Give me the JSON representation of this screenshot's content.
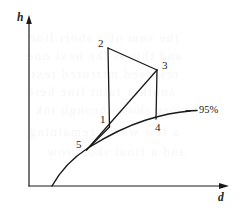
{
  "figure": {
    "type": "thermodynamic-cycle-diagram",
    "background_color": "#ffffff",
    "line_color": "#1a1a1a",
    "axes": {
      "y_label": "h",
      "x_label": "d",
      "y_axis": {
        "x": 29,
        "y_top": 18,
        "y_bottom": 186
      },
      "x_axis": {
        "y": 186,
        "x_left": 29,
        "x_right": 228
      }
    },
    "curve": {
      "label": "95%",
      "label_x": 199,
      "label_y": 107,
      "leader_line": {
        "x1": 188,
        "y1": 111,
        "x2": 198,
        "y2": 111
      },
      "path": "M 52 186 C 62 168, 74 157, 88 148 C 104 138, 124 127, 146 120 C 162 115, 178 112, 190 111"
    },
    "points": [
      {
        "id": "1",
        "x": 109,
        "y": 124,
        "label": "1",
        "label_x": 100,
        "label_y": 115
      },
      {
        "id": "2",
        "x": 108,
        "y": 48,
        "label": "2",
        "label_x": 98,
        "label_y": 39
      },
      {
        "id": "3",
        "x": 157,
        "y": 70,
        "label": "3",
        "label_x": 162,
        "label_y": 61
      },
      {
        "id": "4",
        "x": 156,
        "y": 118,
        "label": "4",
        "label_x": 155,
        "label_y": 122
      },
      {
        "id": "5",
        "x": 86,
        "y": 150,
        "label": "5",
        "label_x": 76,
        "label_y": 139
      }
    ],
    "process_lines": [
      {
        "name": "line-2-to-1",
        "from": "2",
        "to": "1",
        "x1": 108,
        "y1": 48,
        "x2": 109,
        "y2": 126
      },
      {
        "name": "line-2-to-3",
        "from": "2",
        "to": "3",
        "x1": 108,
        "y1": 48,
        "x2": 157,
        "y2": 70
      },
      {
        "name": "line-3-to-4",
        "from": "3",
        "to": "4",
        "x1": 157,
        "y1": 70,
        "x2": 156,
        "y2": 119
      },
      {
        "name": "line-5-to-3",
        "from": "5",
        "to": "3",
        "x1": 86,
        "y1": 150,
        "x2": 157,
        "y2": 70
      },
      {
        "name": "line-5-to-1",
        "from": "5",
        "to": "1",
        "x1": 86,
        "y1": 150,
        "x2": 109,
        "y2": 126
      }
    ],
    "bleed_text": [
      {
        "text": "the sum of a short line",
        "x": 28,
        "y": 30
      },
      {
        "text": "and this is the next one",
        "x": 26,
        "y": 48
      },
      {
        "text": "reversed mirrored text",
        "x": 30,
        "y": 66
      },
      {
        "text": "another faint line here",
        "x": 26,
        "y": 84
      },
      {
        "text": "more show-through ink",
        "x": 34,
        "y": 102
      },
      {
        "text": "a few words remaining",
        "x": 28,
        "y": 124
      },
      {
        "text": "and a final short row",
        "x": 46,
        "y": 144
      }
    ]
  }
}
